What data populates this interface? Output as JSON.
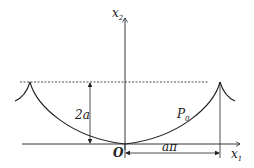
{
  "figure": {
    "type": "cycloid-diagram",
    "axes": {
      "vertical_label": "x",
      "vertical_sub": "2",
      "horizontal_label": "x",
      "horizontal_sub": "1"
    },
    "origin_label": "O",
    "point_label": "P",
    "point_sub": "0",
    "height_label": "2a",
    "width_label": "aπ",
    "colors": {
      "stroke": "#222222",
      "background": "#ffffff"
    }
  }
}
